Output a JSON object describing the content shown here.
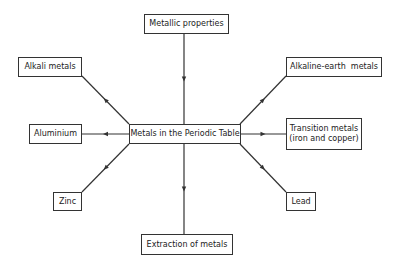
{
  "diagram": {
    "type": "concept-map",
    "center": {
      "id": "center",
      "label": "Metals in the Periodic Table"
    },
    "nodes": [
      {
        "id": "metallic",
        "label": "Metallic properties"
      },
      {
        "id": "alkali",
        "label": "Alkali metals"
      },
      {
        "id": "aluminium",
        "label": "Aluminium"
      },
      {
        "id": "zinc",
        "label": "Zinc"
      },
      {
        "id": "extraction",
        "label": "Extraction of metals"
      },
      {
        "id": "alkearth",
        "label": "Alkaline-earth  metals"
      },
      {
        "id": "transition",
        "label": "Transition metals",
        "label2": "(iron and copper)"
      },
      {
        "id": "lead",
        "label": "Lead"
      }
    ],
    "edges": [
      {
        "from": "metallic",
        "to": "center"
      },
      {
        "from": "center",
        "to": "alkali"
      },
      {
        "from": "center",
        "to": "aluminium"
      },
      {
        "from": "center",
        "to": "zinc"
      },
      {
        "from": "center",
        "to": "extraction"
      },
      {
        "from": "center",
        "to": "alkearth"
      },
      {
        "from": "center",
        "to": "transition"
      },
      {
        "from": "center",
        "to": "lead"
      }
    ],
    "colors": {
      "line": "#333333",
      "box_border": "#333333",
      "background": "#ffffff"
    }
  }
}
